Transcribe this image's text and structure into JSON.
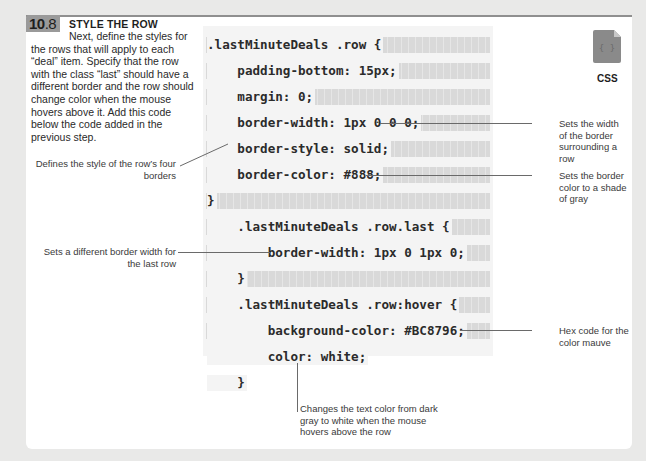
{
  "step": {
    "number_major": "10",
    "number_minor": ".8",
    "title": "STYLE THE ROW",
    "body": "Next, define the styles for the rows that will apply to each “deal” item. Specify that the row with the class “last” should have a different border and the row should change color when the mouse hovers above it. Add this code below the code added in the previous step."
  },
  "file_icon": {
    "icon": "css-file-icon",
    "glyph": "{ }",
    "label": "CSS",
    "color": "#8a8a8a"
  },
  "code": {
    "lines": [
      ".lastMinuteDeals .row {",
      "    padding-bottom: 15px;",
      "    margin: 0;",
      "    border-width: 1px 0 0 0;",
      "    border-style: solid;",
      "    border-color: #888;",
      "}",
      "    .lastMinuteDeals .row.last {",
      "        border-width: 1px 0 1px 0;",
      "    }",
      "    .lastMinuteDeals .row:hover {",
      "        background-color: #BC8796;",
      "        color: white;",
      "    }"
    ]
  },
  "annotations": {
    "border_width": "Sets the width of the border surrounding a row",
    "border_style": "Defines the style of the row’s four borders",
    "border_color": "Sets the border color to a shade of gray",
    "last_row": "Sets a different border width for the last row",
    "hex_mauve": "Hex code for the color mauve",
    "text_color": "Changes the text color from dark gray to white when the mouse hovers above the row"
  },
  "colors": {
    "page_bg": "#e9e9e8",
    "card_bg": "#ffffff",
    "badge_bg": "#9a9a9a",
    "code_bg": "#f4f4f4",
    "code_stripe": "#d9d9d9"
  }
}
